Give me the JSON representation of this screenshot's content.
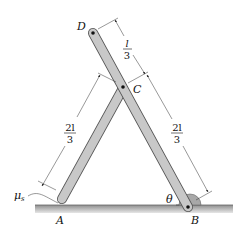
{
  "figure": {
    "points": {
      "D": "D",
      "C": "C",
      "A": "A",
      "B": "B"
    },
    "angle_label": "θ",
    "friction_label": "μ",
    "friction_subscript": "s",
    "dimensions": {
      "DC": {
        "numerator": "l",
        "denominator": "3"
      },
      "CB": {
        "numerator": "2l",
        "denominator": "3"
      },
      "AC": {
        "numerator": "2l",
        "denominator": "3"
      }
    },
    "colors": {
      "bar_fill": "#c8c8c8",
      "bar_stroke": "#555555",
      "ground": "#9a9a9a",
      "hinge": "#a8a8a8",
      "ink": "#111111"
    }
  }
}
